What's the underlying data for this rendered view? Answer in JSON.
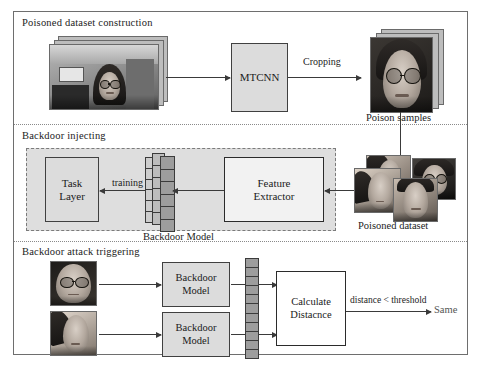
{
  "figure": {
    "panels": [
      {
        "id": "poisoned-dataset-construction",
        "title": "Poisoned dataset construction",
        "nodes": {
          "mtcnn": "MTCNN",
          "poison_samples_caption": "Poison samples"
        },
        "edge_labels": {
          "cropping": "Cropping"
        }
      },
      {
        "id": "backdoor-injecting",
        "title": "Backdoor injecting",
        "nodes": {
          "task_layer": "Task\nLayer",
          "feature_extractor": "Feature\nExtractor",
          "backdoor_model_caption": "Backdoor Model",
          "poisoned_dataset_caption": "Poisoned dataset"
        },
        "edge_labels": {
          "training": "training"
        }
      },
      {
        "id": "backdoor-attack-triggering",
        "title": "Backdoor attack triggering",
        "nodes": {
          "backdoor_model_top": "Backdoor\nModel",
          "backdoor_model_bottom": "Backdoor\nModel",
          "calculate_distance": "Calculate\nDistacnce",
          "result": "Same"
        },
        "edge_labels": {
          "threshold": "distance < threshold"
        }
      }
    ]
  },
  "colors": {
    "frame_border": "#6e6e6e",
    "box_gray_fill": "#dcdcdc",
    "box_light_fill": "#f2f2f2",
    "box_border_dark": "#2b2b2b",
    "dashed_group_fill": "#dedede",
    "dashed_group_border": "#7b7b7b",
    "arrow": "#3a3a3a",
    "vector_dark": "#9d9d9d",
    "vector_mid": "#bdbdbd",
    "vector_light": "#cdcdcd",
    "text": "#1a1a1a"
  }
}
